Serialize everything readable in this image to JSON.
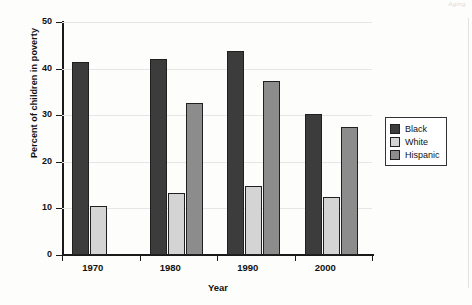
{
  "page": {
    "header_artifact": "Aging",
    "background_color": "#fdfdfc"
  },
  "chart_data": {
    "type": "bar",
    "title": "",
    "subtitle": "",
    "xlabel": "Year",
    "ylabel": "Percent of children in poverty",
    "categories": [
      "1970",
      "1980",
      "1990",
      "2000"
    ],
    "series": [
      {
        "name": "Black",
        "color": "#3c3c3c",
        "values": [
          41.5,
          42.0,
          43.8,
          30.2
        ]
      },
      {
        "name": "White",
        "color": "#d4d4d4",
        "values": [
          10.5,
          13.3,
          14.8,
          12.4
        ]
      },
      {
        "name": "Hispanic",
        "color": "#8c8c8c",
        "values": [
          null,
          32.6,
          37.3,
          27.4
        ]
      }
    ],
    "ylim": [
      0,
      50
    ],
    "yticks": [
      0,
      10,
      20,
      30,
      40,
      50
    ],
    "ytick_labels": [
      "0",
      "10",
      "20",
      "30",
      "40",
      "50"
    ],
    "grid": true,
    "grid_color": "#e6e6e6",
    "legend_position": "right",
    "bar_outline_color": "#202020",
    "axis_color": "#1a1a1a"
  }
}
